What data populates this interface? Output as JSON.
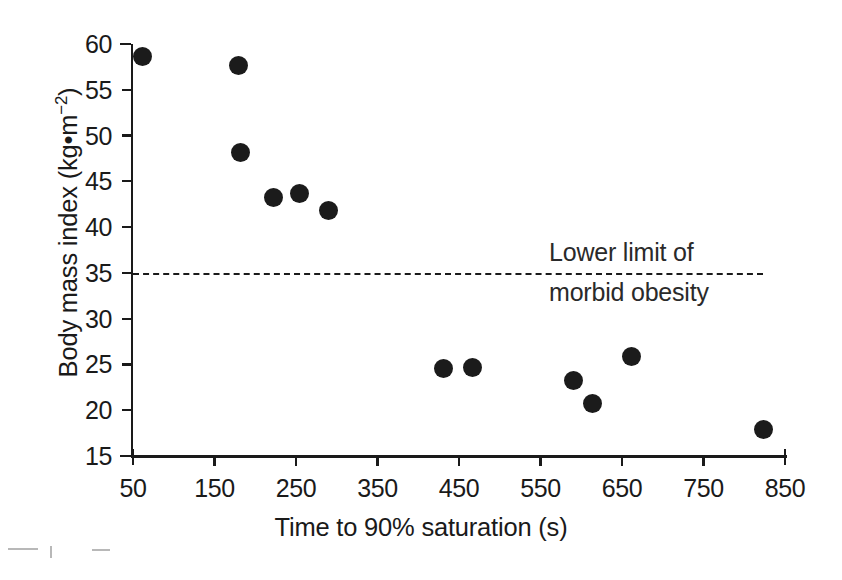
{
  "chart_data": {
    "type": "scatter",
    "title": "",
    "xlabel": "Time to 90% saturation (s)",
    "ylabel": "Body mass index (kg•m⁻²)",
    "ylabel_base": "Body mass index (kg•m",
    "ylabel_exponent": "−2",
    "ylabel_close": ")",
    "xlim": [
      50,
      850
    ],
    "ylim": [
      15,
      60
    ],
    "grid": false,
    "legend": "none",
    "xticks": [
      50,
      150,
      250,
      350,
      450,
      550,
      650,
      750,
      850
    ],
    "xtick_labels": [
      "50",
      "150",
      "250",
      "350",
      "450",
      "550",
      "650",
      "750",
      "850"
    ],
    "yticks": [
      15,
      20,
      25,
      30,
      35,
      40,
      45,
      50,
      55,
      60
    ],
    "ytick_labels": [
      "15",
      "20",
      "25",
      "30",
      "35",
      "40",
      "45",
      "50",
      "55",
      "60"
    ],
    "points": [
      {
        "x": 62,
        "y": 58.6
      },
      {
        "x": 180,
        "y": 57.6
      },
      {
        "x": 182,
        "y": 48.2
      },
      {
        "x": 222,
        "y": 43.2
      },
      {
        "x": 254,
        "y": 43.7
      },
      {
        "x": 290,
        "y": 41.8
      },
      {
        "x": 431,
        "y": 24.6
      },
      {
        "x": 466,
        "y": 24.7
      },
      {
        "x": 590,
        "y": 23.3
      },
      {
        "x": 614,
        "y": 20.7
      },
      {
        "x": 662,
        "y": 25.9
      },
      {
        "x": 824,
        "y": 17.9
      }
    ],
    "reference_line": {
      "value": 35,
      "orientation": "horizontal",
      "style": "dashed",
      "x_start": 50,
      "x_end": 823,
      "label_line_1": "Lower limit of",
      "label_line_2": "morbid obesity"
    },
    "colors": {
      "marker": "#1b1b1b",
      "axis": "#1a1a1a",
      "background": "#ffffff",
      "text": "#1a1a1a"
    }
  }
}
